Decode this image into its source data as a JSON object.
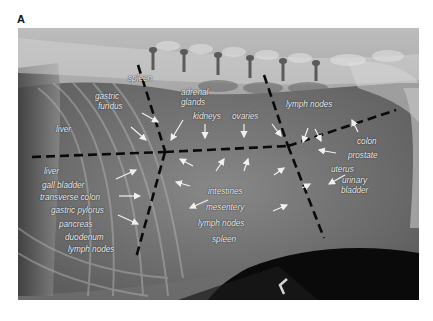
{
  "figure": {
    "panel_letter": "A",
    "image_description": "Lateral abdominal radiograph with anatomical region labels",
    "marker": "L-shaped position marker"
  },
  "labels": {
    "spleen_top": "spleen",
    "gastric": "gastric",
    "fundus": "fundus",
    "liver_top": "liver",
    "adrenal": "adrenal",
    "glands": "glands",
    "kidneys": "kidneys",
    "ovaries": "ovaries",
    "lymph_nodes_top": "lymph nodes",
    "colon": "colon",
    "prostate": "prostate",
    "uterus": "uterus",
    "urinary": "urinary",
    "bladder": "bladder",
    "liver_lower": "liver",
    "gall_bladder": "gall bladder",
    "transverse_colon": "transverse colon",
    "gastric_pylorus": "gastric pylorus",
    "pancreas": "pancreas",
    "duodenum": "duodenum",
    "lymph_nodes_left": "lymph nodes",
    "intestines": "intestines",
    "mesentery": "mesentery",
    "lymph_nodes_mid": "lymph nodes",
    "spleen_bottom": "spleen"
  },
  "colors": {
    "dashed_line": "#0a0a0a",
    "arrow": "#f0f0f0",
    "label_text": "#f2f2f2"
  }
}
